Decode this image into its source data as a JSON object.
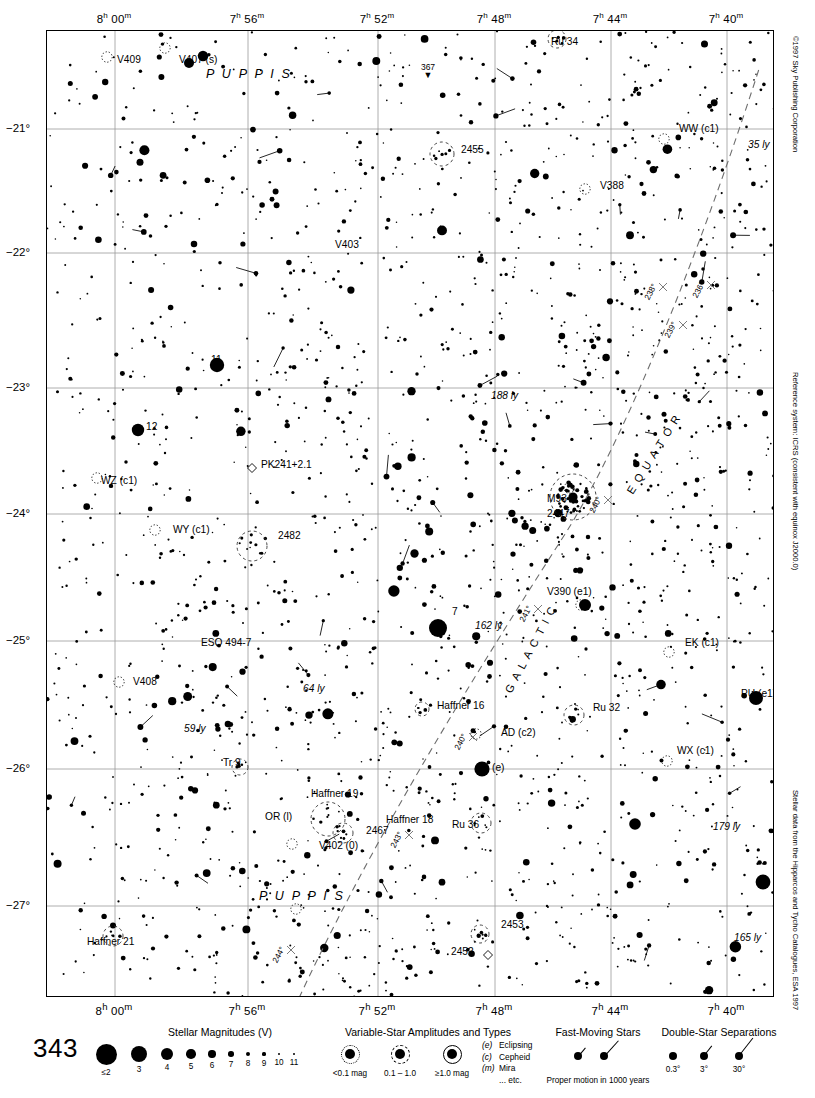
{
  "chart": {
    "number": "343",
    "page_ref": "367",
    "constellation_labels": [
      {
        "text": "P U P P I S",
        "x": 205,
        "y": 77
      },
      {
        "text": "P U P P I S",
        "x": 258,
        "y": 899
      }
    ],
    "copyright": "©1997 Sky Publishing Corporation",
    "reference_system": "Reference system: ICRS (consistent with equinox J2000.0)",
    "data_credit": "Stellar data from the Hipparcos and Tycho Catalogues, ESA 1997"
  },
  "axes": {
    "ra_labels": [
      {
        "h": "8",
        "m": "00",
        "x": 114
      },
      {
        "h": "7",
        "m": "56",
        "x": 247
      },
      {
        "h": "7",
        "m": "52",
        "x": 377
      },
      {
        "h": "7",
        "m": "48",
        "x": 494
      },
      {
        "h": "7",
        "m": "44",
        "x": 610
      },
      {
        "h": "7",
        "m": "40",
        "x": 726
      }
    ],
    "dec_labels": [
      {
        "text": "−21°",
        "y": 128
      },
      {
        "text": "−22°",
        "y": 252
      },
      {
        "text": "−23°",
        "y": 387
      },
      {
        "text": "−24°",
        "y": 513
      },
      {
        "text": "−25°",
        "y": 640
      },
      {
        "text": "−26°",
        "y": 768
      },
      {
        "text": "−27°",
        "y": 905
      }
    ]
  },
  "galactic": {
    "equator_label": "E Q U A T O R",
    "galactic_label": "G A L A C T I C",
    "longitude_ticks": [
      "236°",
      "238°",
      "239°",
      "240°",
      "241°",
      "243°",
      "244°"
    ]
  },
  "objects": [
    {
      "label": "V409",
      "x": 116,
      "y": 62,
      "type": "variable"
    },
    {
      "label": "V407 (s)",
      "x": 178,
      "y": 62,
      "type": "variable"
    },
    {
      "label": "Ru 34",
      "x": 550,
      "y": 44,
      "type": "cluster"
    },
    {
      "label": "WW (c1)",
      "x": 678,
      "y": 131,
      "type": "variable"
    },
    {
      "label": "35 ly",
      "x": 747,
      "y": 147,
      "type": "distance"
    },
    {
      "label": "2455",
      "x": 460,
      "y": 152,
      "type": "cluster"
    },
    {
      "label": "V388",
      "x": 599,
      "y": 188,
      "type": "variable"
    },
    {
      "label": "V403",
      "x": 334,
      "y": 247,
      "type": "variable"
    },
    {
      "label": "11",
      "x": 210,
      "y": 362,
      "type": "star"
    },
    {
      "label": "188 ly",
      "x": 490,
      "y": 398,
      "type": "distance"
    },
    {
      "label": "12",
      "x": 145,
      "y": 429,
      "type": "star"
    },
    {
      "label": "PK241+2.1",
      "x": 260,
      "y": 467,
      "type": "planetary"
    },
    {
      "label": "WZ (c1)",
      "x": 100,
      "y": 483,
      "type": "variable"
    },
    {
      "label": "M93",
      "x": 546,
      "y": 501,
      "type": "cluster"
    },
    {
      "label": "2447",
      "x": 546,
      "y": 516,
      "type": "cluster"
    },
    {
      "label": "WY (c1)",
      "x": 172,
      "y": 532,
      "type": "variable"
    },
    {
      "label": "2482",
      "x": 277,
      "y": 538,
      "type": "cluster"
    },
    {
      "label": "V390 (e1)",
      "x": 546,
      "y": 594,
      "type": "variable"
    },
    {
      "label": "7",
      "x": 451,
      "y": 614,
      "type": "star"
    },
    {
      "label": "162 ly",
      "x": 474,
      "y": 628,
      "type": "distance"
    },
    {
      "label": "EK (c1)",
      "x": 684,
      "y": 645,
      "type": "variable"
    },
    {
      "label": "ESO 494-7",
      "x": 200,
      "y": 645,
      "type": "galaxy"
    },
    {
      "label": "V408",
      "x": 132,
      "y": 684,
      "type": "variable"
    },
    {
      "label": "64 ly",
      "x": 302,
      "y": 691,
      "type": "distance"
    },
    {
      "label": "PU (e1)",
      "x": 740,
      "y": 696,
      "type": "variable"
    },
    {
      "label": "Haffner 16",
      "x": 436,
      "y": 708,
      "type": "cluster"
    },
    {
      "label": "Ru 32",
      "x": 592,
      "y": 710,
      "type": "cluster"
    },
    {
      "label": "AD (c2)",
      "x": 500,
      "y": 735,
      "type": "variable"
    },
    {
      "label": "59 ly",
      "x": 183,
      "y": 731,
      "type": "distance"
    },
    {
      "label": "WX (c1)",
      "x": 676,
      "y": 753,
      "type": "variable"
    },
    {
      "label": "Tr 9",
      "x": 222,
      "y": 765,
      "type": "cluster"
    },
    {
      "label": "(e)",
      "x": 491,
      "y": 770,
      "type": "variable"
    },
    {
      "label": "Haffner 19",
      "x": 310,
      "y": 796,
      "type": "cluster"
    },
    {
      "label": "OR (l)",
      "x": 264,
      "y": 819,
      "type": "variable"
    },
    {
      "label": "Haffner 18",
      "x": 385,
      "y": 822,
      "type": "cluster"
    },
    {
      "label": "2467",
      "x": 365,
      "y": 833,
      "type": "cluster"
    },
    {
      "label": "Ru 36",
      "x": 451,
      "y": 827,
      "type": "cluster"
    },
    {
      "label": "179 ly",
      "x": 712,
      "y": 829,
      "type": "distance"
    },
    {
      "label": "V402 (0)",
      "x": 318,
      "y": 848,
      "type": "variable"
    },
    {
      "label": "2453",
      "x": 500,
      "y": 927,
      "type": "cluster"
    },
    {
      "label": "2452",
      "x": 450,
      "y": 954,
      "type": "planetary"
    },
    {
      "label": "165 ly",
      "x": 733,
      "y": 940,
      "type": "distance"
    },
    {
      "label": "Haffner 21",
      "x": 86,
      "y": 944,
      "type": "cluster"
    }
  ],
  "legend": {
    "magnitudes": {
      "title": "Stellar Magnitudes (V)",
      "title_x": 220,
      "entries": [
        {
          "label": "≤2",
          "d": 21.0,
          "x": 106
        },
        {
          "label": "3",
          "d": 16.0,
          "x": 139
        },
        {
          "label": "4",
          "d": 12.4,
          "x": 167
        },
        {
          "label": "5",
          "d": 9.6,
          "x": 191
        },
        {
          "label": "6",
          "d": 7.4,
          "x": 212
        },
        {
          "label": "7",
          "d": 5.6,
          "x": 231
        },
        {
          "label": "8",
          "d": 4.2,
          "x": 248
        },
        {
          "label": "9",
          "d": 3.2,
          "x": 264
        },
        {
          "label": "10",
          "d": 2.6,
          "x": 279
        },
        {
          "label": "11",
          "d": 2.0,
          "x": 294
        }
      ]
    },
    "variables": {
      "title": "Variable-Star Amplitudes and Types",
      "title_x": 428,
      "entries": [
        {
          "label": "<0.1 mag",
          "x": 350,
          "core": 10.0,
          "ring": "dotted"
        },
        {
          "label": "0.1 – 1.0",
          "x": 400,
          "core": 10.0,
          "ring": "dashed"
        },
        {
          "label": "≥1.0 mag",
          "x": 452,
          "core": 10.0,
          "ring": "solid"
        }
      ],
      "types": [
        {
          "code": "(e)",
          "name": "Eclipsing"
        },
        {
          "code": "(c)",
          "name": "Cepheid"
        },
        {
          "code": "(m)",
          "name": "Mira"
        },
        {
          "code": "",
          "name": "... etc."
        }
      ]
    },
    "fast_moving": {
      "title": "Fast-Moving Stars",
      "title_x": 598,
      "caption": "Proper motion in 1000 years"
    },
    "double_stars": {
      "title": "Double-Star Separations",
      "title_x": 719,
      "entries": [
        {
          "label": "0.3°",
          "x": 673
        },
        {
          "label": "3°",
          "x": 704
        },
        {
          "label": "30°",
          "x": 739
        }
      ]
    }
  }
}
